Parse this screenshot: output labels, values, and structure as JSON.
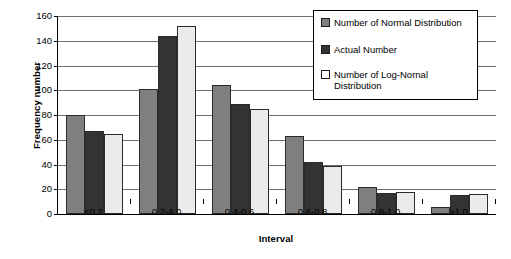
{
  "chart_data": {
    "type": "bar",
    "title": "",
    "xlabel": "Interval",
    "ylabel": "Frequency number",
    "categories": [
      "<0.2",
      "0.2-4.0",
      "0.4-0.6",
      "0.6-0.8",
      "0.8-1.0",
      ">1.0"
    ],
    "ylim": [
      0,
      160
    ],
    "ytick_step": 20,
    "yticks": [
      "0",
      "20",
      "40",
      "60",
      "80",
      "100",
      "120",
      "140",
      "160"
    ],
    "grid": true,
    "legend_position": "top-right",
    "series": [
      {
        "name": "Number of Normal Distribution",
        "color": "#7f7f7f",
        "values": [
          80,
          101,
          104,
          63,
          22,
          6
        ]
      },
      {
        "name": "Actual Number",
        "color": "#333333",
        "values": [
          67,
          144,
          89,
          42,
          17,
          15
        ]
      },
      {
        "name": "Number of Log-Nornal Distribution",
        "color": "#ebebeb",
        "values": [
          65,
          152,
          85,
          39,
          18,
          16
        ]
      }
    ]
  },
  "legend": {
    "items": [
      {
        "label": "Number of Normal Distribution"
      },
      {
        "label": "Actual Number"
      },
      {
        "label": "Number of Log-Nornal Distribution"
      }
    ]
  }
}
